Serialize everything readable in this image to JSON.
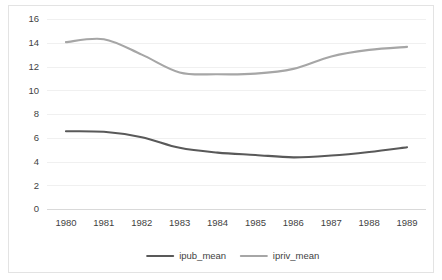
{
  "chart_data": {
    "type": "line",
    "title": "",
    "xlabel": "",
    "ylabel": "",
    "x": [
      1980,
      1981,
      1982,
      1983,
      1984,
      1985,
      1986,
      1987,
      1988,
      1989
    ],
    "categories": [
      "1980",
      "1981",
      "1982",
      "1983",
      "1984",
      "1985",
      "1986",
      "1987",
      "1988",
      "1989"
    ],
    "series": [
      {
        "name": "ipub_mean",
        "color": "#595959",
        "values": [
          6.55,
          6.5,
          6.05,
          5.15,
          4.75,
          4.55,
          4.35,
          4.5,
          4.8,
          5.2
        ]
      },
      {
        "name": "ipriv_mean",
        "color": "#a6a6a6",
        "values": [
          14.05,
          14.3,
          13.0,
          11.5,
          11.35,
          11.4,
          11.8,
          12.85,
          13.4,
          13.65
        ]
      }
    ],
    "ylim": [
      0,
      16
    ],
    "ytick_step": 2,
    "yticks": [
      "0",
      "2",
      "4",
      "6",
      "8",
      "10",
      "12",
      "14",
      "16"
    ],
    "grid": true,
    "smooth": true,
    "legend_position": "bottom",
    "legend": [
      {
        "label": "ipub_mean",
        "color": "#595959"
      },
      {
        "label": "ipriv_mean",
        "color": "#a6a6a6"
      }
    ],
    "colors": {
      "gridline": "#f0f0f0",
      "axis": "#d9d9d9",
      "text": "#3f3f3f",
      "border": "#e3e3e3",
      "background": "#ffffff"
    }
  }
}
